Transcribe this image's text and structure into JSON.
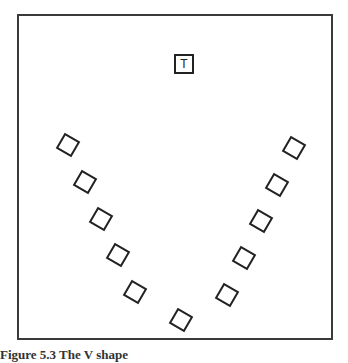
{
  "diagram": {
    "teacher": {
      "label": "T",
      "x": 184,
      "y": 64
    },
    "seats": [
      {
        "x": 68,
        "y": 145,
        "rotate": 30
      },
      {
        "x": 85,
        "y": 182,
        "rotate": 30
      },
      {
        "x": 101,
        "y": 219,
        "rotate": 30
      },
      {
        "x": 118,
        "y": 255,
        "rotate": 30
      },
      {
        "x": 135,
        "y": 292,
        "rotate": 30
      },
      {
        "x": 181,
        "y": 320,
        "rotate": 30
      },
      {
        "x": 227,
        "y": 295,
        "rotate": 30
      },
      {
        "x": 244,
        "y": 258,
        "rotate": 30
      },
      {
        "x": 261,
        "y": 221,
        "rotate": 30
      },
      {
        "x": 277,
        "y": 185,
        "rotate": 30
      },
      {
        "x": 294,
        "y": 148,
        "rotate": 30
      }
    ]
  },
  "caption": "Figure 5.3   The V shape"
}
